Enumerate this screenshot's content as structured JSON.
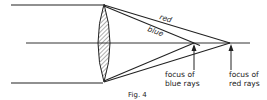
{
  "figure": {
    "caption": "Fig. 4",
    "ray_labels": {
      "red": "red",
      "blue": "blue"
    },
    "focus_labels": {
      "blue": [
        "focus of",
        "blue rays"
      ],
      "red": [
        "focus of",
        "red rays"
      ]
    },
    "colors": {
      "ink": "#222222",
      "background": "#ffffff"
    }
  }
}
